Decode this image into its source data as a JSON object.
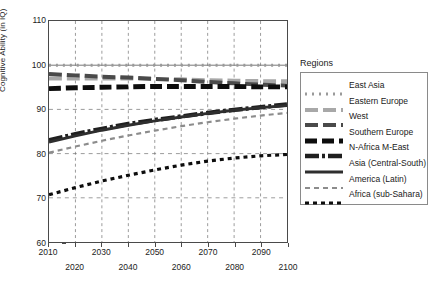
{
  "chart_data": {
    "type": "line",
    "title": "",
    "xlabel": "",
    "ylabel": "Cognitive Ability (in IQ)",
    "xlim": [
      2010,
      2100
    ],
    "ylim": [
      60,
      110
    ],
    "yticks": [
      60,
      70,
      80,
      90,
      100,
      110
    ],
    "xticks": [
      2010,
      2020,
      2030,
      2040,
      2050,
      2060,
      2070,
      2080,
      2090,
      2100
    ],
    "xticks_upper_row": [
      2010,
      2030,
      2050,
      2070,
      2090
    ],
    "xticks_lower_row": [
      2020,
      2040,
      2060,
      2080,
      2100
    ],
    "grid": "dashed vertical every 10 years; dashed horizontal at 70, 80, 90, 100",
    "legend_position": "right-outside",
    "legend_title": "Regions",
    "x": [
      2010,
      2020,
      2030,
      2040,
      2050,
      2060,
      2070,
      2080,
      2090,
      2100
    ],
    "series": [
      {
        "name": "East Asia",
        "style": "fine-dotted",
        "color": "#9a9a9a",
        "values": [
          100.0,
          100.0,
          100.0,
          100.0,
          100.0,
          100.0,
          100.0,
          100.0,
          100.0,
          100.0
        ]
      },
      {
        "name": "Eastern Europe",
        "style": "long-dash",
        "color": "#a8a8a8",
        "values": [
          97.0,
          97.0,
          97.0,
          97.0,
          96.9,
          96.8,
          96.6,
          96.5,
          96.4,
          96.4
        ]
      },
      {
        "name": "West",
        "style": "long-dash",
        "color": "#4a4a4a",
        "values": [
          98.0,
          97.7,
          97.4,
          97.2,
          96.9,
          96.6,
          96.2,
          95.9,
          95.6,
          95.4
        ]
      },
      {
        "name": "Southern Europe",
        "style": "thick-dash",
        "color": "#0d0d0d",
        "values": [
          94.7,
          94.9,
          95.0,
          95.1,
          95.2,
          95.2,
          95.2,
          95.2,
          95.1,
          95.1
        ]
      },
      {
        "name": "N-Africa M-East",
        "style": "dash-dot-thick",
        "color": "#1f1f1f",
        "values": [
          83.0,
          84.4,
          85.6,
          86.7,
          87.6,
          88.4,
          89.2,
          89.9,
          90.5,
          91.1
        ]
      },
      {
        "name": "Asia (Central-South)",
        "style": "solid",
        "color": "#2e2e2e",
        "values": [
          82.6,
          84.0,
          85.3,
          86.4,
          87.4,
          88.3,
          89.1,
          89.8,
          90.4,
          90.9
        ]
      },
      {
        "name": "America (Latin)",
        "style": "short-dash",
        "color": "#8c8c8c",
        "values": [
          80.2,
          81.6,
          82.9,
          84.1,
          85.2,
          86.2,
          87.1,
          87.9,
          88.6,
          89.2
        ]
      },
      {
        "name": "Africa (sub-Sahara)",
        "style": "square-dot",
        "color": "#0d0d0d",
        "values": [
          70.7,
          72.3,
          73.8,
          75.1,
          76.3,
          77.4,
          78.3,
          79.0,
          79.5,
          79.8
        ]
      }
    ]
  },
  "axes": {
    "y_title": "Cognitive Ability (in IQ)",
    "y_labels": [
      "110",
      "100",
      "90",
      "80",
      "70",
      "60"
    ],
    "x_labels_upper": [
      "2010",
      "2030",
      "2050",
      "2070",
      "2090"
    ],
    "x_labels_lower": [
      "2020",
      "2040",
      "2060",
      "2080",
      "2100"
    ]
  },
  "legend": {
    "title": "Regions",
    "items": [
      {
        "label": "East Asia"
      },
      {
        "label": "Eastern Europe"
      },
      {
        "label": "West"
      },
      {
        "label": "Southern Europe"
      },
      {
        "label": "N-Africa M-East"
      },
      {
        "label": "Asia (Central-South)"
      },
      {
        "label": "America (Latin)"
      },
      {
        "label": "Africa (sub-Sahara)"
      }
    ]
  }
}
